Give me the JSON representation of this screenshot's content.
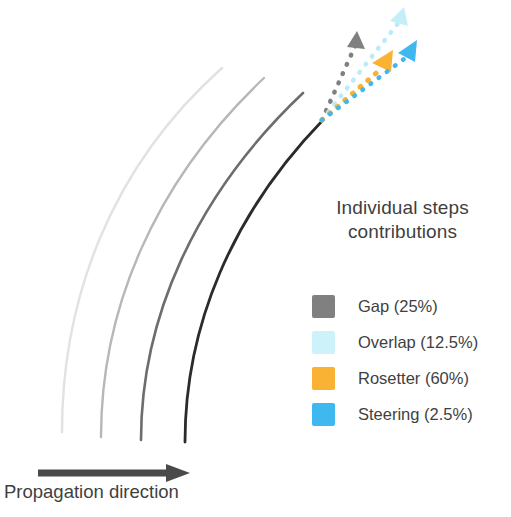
{
  "figure": {
    "background_color": "#ffffff",
    "legend": {
      "title_line1": "Individual steps",
      "title_line2": "contributions",
      "items": [
        {
          "label": "Gap (25%)",
          "name": "Gap",
          "percent": 25,
          "color": "#808080"
        },
        {
          "label": "Overlap (12.5%)",
          "name": "Overlap",
          "percent": 12.5,
          "color": "#cdf2fa"
        },
        {
          "label": "Rosetter (60%)",
          "name": "Rosetter",
          "percent": 60,
          "color": "#f9b233"
        },
        {
          "label": "Steering (2.5%)",
          "name": "Steering",
          "percent": 2.5,
          "color": "#3fb8f0"
        }
      ]
    },
    "propagation": {
      "caption": "Propagation direction",
      "arrow_color": "#4a4a4a"
    },
    "paths": {
      "label": "nested weld bead curves",
      "stroke_colors": [
        "#e0e0e0",
        "#b5b5b5",
        "#6b6b6b",
        "#2b2b2b"
      ]
    },
    "step_arrows": {
      "label": "individual step contribution vectors",
      "origin": "weld tip",
      "vectors": [
        {
          "name": "Gap",
          "color": "#808080",
          "angle_deg": -62,
          "length": 92
        },
        {
          "name": "Overlap",
          "color": "#b6eaf7",
          "angle_deg": -52,
          "length": 136
        },
        {
          "name": "Rosetter",
          "color": "#f9b233",
          "angle_deg": -40,
          "length": 85
        },
        {
          "name": "Steering",
          "color": "#3fb8f0",
          "angle_deg": -36,
          "length": 118
        }
      ]
    }
  }
}
